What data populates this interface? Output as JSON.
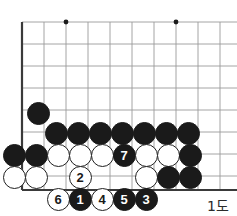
{
  "figure": {
    "caption": "1도",
    "kind": "go-board-diagram",
    "colors": {
      "black_stone": "#1a1a1a",
      "white_stone": "#ffffff",
      "stone_outline": "#1f1f1f",
      "grid_line": "#9a9a9a",
      "edge_line": "#3a3a3a",
      "star_point": "#1a1a1a",
      "background": "#ffffff"
    }
  },
  "board": {
    "label": "Go board corner",
    "origin_x": 22,
    "origin_y": 22,
    "spacing": 22,
    "cols": 10,
    "rows": 8,
    "edges": [
      "left",
      "bottom"
    ],
    "grid_x": [
      22,
      44,
      66,
      88,
      110,
      132,
      154,
      176,
      198,
      220
    ],
    "grid_y": [
      22,
      44,
      66,
      88,
      110,
      132,
      154,
      176,
      190
    ],
    "star_points": [
      {
        "name": "star-point-top-left",
        "cx": 66,
        "cy": 22
      },
      {
        "name": "star-point-top-right",
        "cx": 176,
        "cy": 22
      },
      {
        "name": "star-point-lower-right",
        "cx": 176,
        "cy": 133
      }
    ]
  },
  "stones": [
    {
      "name": "black-stone-b8",
      "color": "black",
      "cx": 38,
      "cy": 113,
      "label": ""
    },
    {
      "name": "black-stone-c7",
      "color": "black",
      "cx": 56,
      "cy": 133,
      "label": ""
    },
    {
      "name": "black-stone-d7",
      "color": "black",
      "cx": 78,
      "cy": 133,
      "label": ""
    },
    {
      "name": "black-stone-e7",
      "color": "black",
      "cx": 100,
      "cy": 133,
      "label": ""
    },
    {
      "name": "black-stone-f7",
      "color": "black",
      "cx": 122,
      "cy": 133,
      "label": ""
    },
    {
      "name": "black-stone-g7",
      "color": "black",
      "cx": 144,
      "cy": 133,
      "label": ""
    },
    {
      "name": "black-stone-h7",
      "color": "black",
      "cx": 166,
      "cy": 133,
      "label": ""
    },
    {
      "name": "black-stone-i7",
      "color": "black",
      "cx": 188,
      "cy": 133,
      "label": ""
    },
    {
      "name": "black-stone-a6",
      "color": "black",
      "cx": 14,
      "cy": 155,
      "label": ""
    },
    {
      "name": "black-stone-b6",
      "color": "black",
      "cx": 36,
      "cy": 155,
      "label": ""
    },
    {
      "name": "white-stone-c6",
      "color": "white",
      "cx": 58,
      "cy": 155,
      "label": ""
    },
    {
      "name": "white-stone-d6",
      "color": "white",
      "cx": 80,
      "cy": 155,
      "label": ""
    },
    {
      "name": "white-stone-e6",
      "color": "white",
      "cx": 102,
      "cy": 155,
      "label": ""
    },
    {
      "name": "black-stone-move-7",
      "color": "black",
      "cx": 124,
      "cy": 155,
      "label": "7"
    },
    {
      "name": "white-stone-g6",
      "color": "white",
      "cx": 146,
      "cy": 155,
      "label": ""
    },
    {
      "name": "white-stone-h6",
      "color": "white",
      "cx": 168,
      "cy": 155,
      "label": ""
    },
    {
      "name": "black-stone-i6",
      "color": "black",
      "cx": 190,
      "cy": 155,
      "label": ""
    },
    {
      "name": "white-stone-a5",
      "color": "white",
      "cx": 14,
      "cy": 177,
      "label": ""
    },
    {
      "name": "white-stone-b5",
      "color": "white",
      "cx": 36,
      "cy": 177,
      "label": ""
    },
    {
      "name": "white-stone-move-2",
      "color": "white",
      "cx": 80,
      "cy": 177,
      "label": "2"
    },
    {
      "name": "white-stone-g5",
      "color": "white",
      "cx": 146,
      "cy": 177,
      "label": ""
    },
    {
      "name": "black-stone-h5",
      "color": "black",
      "cx": 168,
      "cy": 177,
      "label": ""
    },
    {
      "name": "black-stone-i5",
      "color": "black",
      "cx": 190,
      "cy": 177,
      "label": ""
    },
    {
      "name": "white-stone-move-6",
      "color": "white",
      "cx": 58,
      "cy": 199,
      "label": "6"
    },
    {
      "name": "black-stone-move-1",
      "color": "black",
      "cx": 80,
      "cy": 199,
      "label": "1"
    },
    {
      "name": "white-stone-move-4",
      "color": "white",
      "cx": 102,
      "cy": 199,
      "label": "4"
    },
    {
      "name": "black-stone-move-5",
      "color": "black",
      "cx": 124,
      "cy": 199,
      "label": "5"
    },
    {
      "name": "black-stone-move-3",
      "color": "black",
      "cx": 146,
      "cy": 199,
      "label": "3"
    }
  ]
}
